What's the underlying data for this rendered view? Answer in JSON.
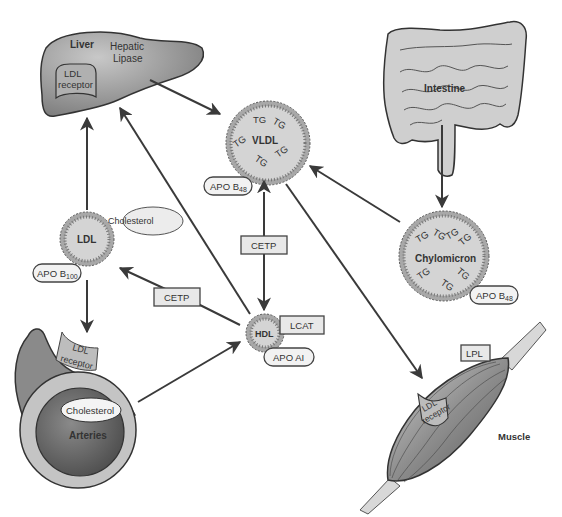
{
  "diagram": {
    "type": "lipoprotein-metabolism-pathway",
    "organs": {
      "liver": {
        "label": "Liver",
        "enzyme": [
          "Hepatic",
          "Lipase"
        ],
        "receptor": [
          "LDL",
          "receptor"
        ]
      },
      "intestine": {
        "label": "Intestine"
      },
      "arteries": {
        "label": "Arteries",
        "deposit": "Cholesterol",
        "receptor": [
          "LDL",
          "receptor"
        ]
      },
      "muscle": {
        "label": "Muscle",
        "enzyme": "LPL",
        "receptor": [
          "LDL",
          "receptor"
        ]
      }
    },
    "particles": {
      "vldl": {
        "label": "VLDL",
        "content": "TG",
        "apo": "APO B",
        "apo_sub": "48"
      },
      "chylomicron": {
        "label": "Chylomicron",
        "content": "TG",
        "apo": "APO B",
        "apo_sub": "48"
      },
      "ldl": {
        "label": "LDL",
        "attached": "Cholesterol",
        "apo": "APO B",
        "apo_sub": "100"
      },
      "hdl": {
        "label": "HDL",
        "enzyme": "LCAT",
        "apo": "APO AI"
      }
    },
    "enzymes": {
      "cetp_vertical": "CETP",
      "cetp_diagonal": "CETP"
    },
    "flows": [
      {
        "from": "liver",
        "to": "vldl"
      },
      {
        "from": "intestine",
        "to": "chylomicron"
      },
      {
        "from": "chylomicron",
        "to": "vldl"
      },
      {
        "from": "vldl",
        "to": "muscle"
      },
      {
        "from": "vldl",
        "to": "hdl",
        "bidirectional": true,
        "via": "CETP"
      },
      {
        "from": "hdl",
        "to": "ldl",
        "via": "CETP"
      },
      {
        "from": "hdl",
        "to": "liver"
      },
      {
        "from": "ldl",
        "to": "liver"
      },
      {
        "from": "ldl",
        "to": "arteries"
      },
      {
        "from": "arteries",
        "to": "hdl"
      }
    ],
    "colors": {
      "particle_fill": "#d4d4d4",
      "bead_fill": "#a8a8a8",
      "organ_fill": "#9a9a9a",
      "intestine_fill": "#cfcfcf",
      "line": "#3a3a3a"
    }
  }
}
